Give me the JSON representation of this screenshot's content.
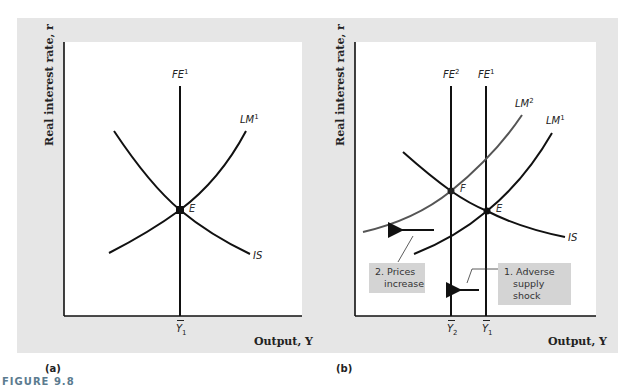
{
  "figure": {
    "title": "FIGURE 9.8",
    "colors": {
      "panel_bg": "#e6e6e6",
      "plot_bg": "#ffffff",
      "curve": "#111111",
      "curve_new": "#555555",
      "note_bg": "#d4d4d4",
      "title": "#5b7b8f"
    }
  },
  "panel_a": {
    "tag": "(a)",
    "ylabel": "Real interest rate, r",
    "xlabel": "Output, Y",
    "curves": {
      "fe1": {
        "name": "FE",
        "sup": "1"
      },
      "lm1": {
        "name": "LM",
        "sup": "1"
      },
      "is": {
        "name": "IS"
      }
    },
    "points": {
      "e": "E"
    },
    "ticks": {
      "y1": {
        "name": "Y",
        "sub": "1"
      }
    }
  },
  "panel_b": {
    "tag": "(b)",
    "ylabel": "Real interest rate, r",
    "xlabel": "Output, Y",
    "curves": {
      "fe2": {
        "name": "FE",
        "sup": "2"
      },
      "fe1": {
        "name": "FE",
        "sup": "1"
      },
      "lm2": {
        "name": "LM",
        "sup": "2"
      },
      "lm1": {
        "name": "LM",
        "sup": "1"
      },
      "is": {
        "name": "IS"
      }
    },
    "points": {
      "f": "F",
      "e": "E"
    },
    "ticks": {
      "y2": {
        "name": "Y",
        "sub": "2"
      },
      "y1": {
        "name": "Y",
        "sub": "1"
      }
    },
    "notes": {
      "prices_line1": "2. Prices",
      "prices_line2": "increase",
      "shock_line1": "1. Adverse",
      "shock_line2": "supply shock"
    }
  }
}
